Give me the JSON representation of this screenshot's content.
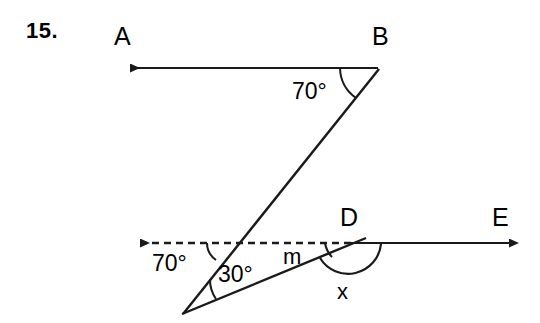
{
  "problem": {
    "number": "15.",
    "type": "geometry-angle-diagram"
  },
  "style": {
    "stroke_color": "#1a1a1a",
    "background_color": "#ffffff",
    "text_color": "#000000",
    "stroke_width": 2
  },
  "points": [
    {
      "id": "A",
      "label": "A",
      "x": 118,
      "y": 68,
      "note": "arrow end of ray BA"
    },
    {
      "id": "B",
      "label": "B",
      "x": 378,
      "y": 68,
      "note": "vertex of 70 degree angle on top line"
    },
    {
      "id": "D",
      "label": "D",
      "x": 352,
      "y": 243,
      "note": "vertex on lower line"
    },
    {
      "id": "E",
      "label": "E",
      "x": 520,
      "y": 243,
      "note": "arrow end of ray DE"
    }
  ],
  "labels": {
    "A": "A",
    "B": "B",
    "D": "D",
    "E": "E"
  },
  "angles": [
    {
      "id": "angle-at-B",
      "text": "70°",
      "vertex": "B",
      "x": 300,
      "y": 87
    },
    {
      "id": "angle-at-dashed-intersection",
      "text": "70°",
      "x": 155,
      "y": 258
    },
    {
      "id": "angle-at-bottom-vertex",
      "text": "30°",
      "x": 226,
      "y": 265
    },
    {
      "id": "angle-m-at-D",
      "text": "m",
      "x": 284,
      "y": 249
    },
    {
      "id": "angle-x-at-D",
      "text": "x",
      "x": 337,
      "y": 281
    }
  ],
  "lines": [
    {
      "id": "ray-BA",
      "from": [
        378,
        68
      ],
      "to": [
        118,
        68
      ],
      "dashed": false,
      "arrow_at_end": true,
      "description": "top horizontal ray from B toward A"
    },
    {
      "id": "transversal-B-to-vertex",
      "from": [
        378,
        68
      ],
      "to": [
        183,
        313
      ],
      "dashed": false,
      "arrow_at_end": false,
      "description": "slanted line from B down-left to bottom vertex"
    },
    {
      "id": "dashed-ray-left",
      "from": [
        352,
        243
      ],
      "to": [
        128,
        243
      ],
      "dashed": true,
      "arrow_at_end": true,
      "description": "dashed horizontal ray left from D"
    },
    {
      "id": "ray-DE",
      "from": [
        352,
        243
      ],
      "to": [
        520,
        243
      ],
      "dashed": false,
      "arrow_at_end": true,
      "description": "solid horizontal ray from D toward E"
    },
    {
      "id": "lower-slant-line",
      "from": [
        183,
        313
      ],
      "to": [
        362,
        239
      ],
      "dashed": false,
      "arrow_at_end": false,
      "description": "slanted line from bottom vertex up-right through D"
    }
  ],
  "arcs": [
    {
      "id": "arc-70-at-B",
      "description": "arc marking 70 degree angle at B"
    },
    {
      "id": "arc-70-at-intersection",
      "description": "arc marking 70 degree angle at dashed line intersection"
    },
    {
      "id": "arc-30-at-vertex",
      "description": "arc marking 30 degree angle at bottom vertex"
    },
    {
      "id": "arc-m-at-D",
      "description": "small arc marking angle m at D"
    },
    {
      "id": "arc-x-at-D",
      "description": "large semicircular arc marking angle x below D"
    }
  ]
}
